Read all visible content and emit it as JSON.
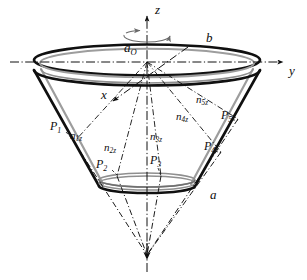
{
  "figure": {
    "background_color": "#ffffff",
    "ink_color": "#0d0d0d",
    "shell_color": "#9a9a9a",
    "axes": {
      "z": {
        "label": "z",
        "x": 155,
        "y": 8,
        "description": "vertical-axis-up"
      },
      "y": {
        "label": "y",
        "x": 290,
        "y": 71,
        "description": "horizontal-axis-right"
      },
      "x": {
        "label": "x",
        "x": 103,
        "y": 95,
        "description": "depth-axis-front-left"
      }
    },
    "rotation": {
      "label": "a",
      "sub": "O",
      "x": 127,
      "y": 40,
      "description": "rotation-about-z-axis"
    },
    "dimensions": [
      {
        "name": "top-radius",
        "label": "b",
        "x": 208,
        "y": 38
      },
      {
        "name": "bottom-radius",
        "label": "a",
        "x": 211,
        "y": 195
      }
    ],
    "points": [
      {
        "name": "P1",
        "label": "P",
        "sub": "1",
        "x": 53,
        "y": 127,
        "px": 74,
        "py": 142
      },
      {
        "name": "P2",
        "label": "P",
        "sub": "2",
        "x": 100,
        "y": 165,
        "px": 117,
        "py": 176
      },
      {
        "name": "P3",
        "label": "P",
        "sub": "3",
        "x": 152,
        "y": 161,
        "px": 161,
        "py": 176
      },
      {
        "name": "P4",
        "label": "P",
        "sub": "4",
        "x": 206,
        "y": 147,
        "px": 221,
        "py": 152
      },
      {
        "name": "P5",
        "label": "P",
        "sub": "5",
        "x": 223,
        "y": 116,
        "px": 238,
        "py": 119
      }
    ],
    "normals": [
      {
        "name": "n1z",
        "label": "n",
        "sub": "1z",
        "x": 73,
        "y": 136
      },
      {
        "name": "n2z",
        "label": "n",
        "sub": "2z",
        "x": 107,
        "y": 148
      },
      {
        "name": "n3z",
        "label": "n",
        "sub": "3z",
        "x": 153,
        "y": 137
      },
      {
        "name": "n4z",
        "label": "n",
        "sub": "4z",
        "x": 179,
        "y": 117
      },
      {
        "name": "n5z",
        "label": "n",
        "sub": "5z",
        "x": 199,
        "y": 100
      }
    ],
    "apex": {
      "name": "cone-apex",
      "x": 147,
      "y": 255
    },
    "geometry": {
      "center_x": 147,
      "top_rim_y": 66,
      "top_rim_rx": 113,
      "top_rim_ry": 16,
      "bottom_rim_y": 186,
      "bottom_rim_rx": 48,
      "bottom_rim_ry": 7
    }
  }
}
